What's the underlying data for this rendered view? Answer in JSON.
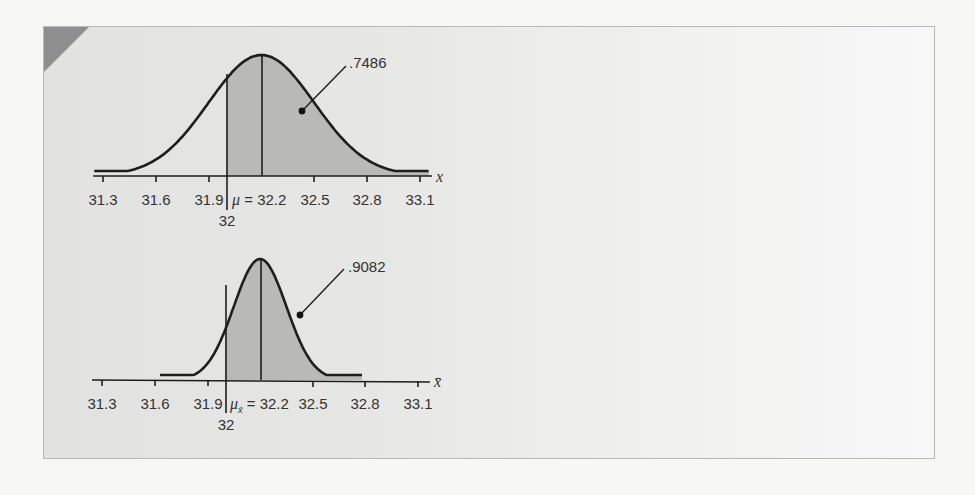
{
  "chart_data": [
    {
      "type": "area",
      "title": "",
      "distribution": "normal",
      "variable": "x",
      "xlabel": "x",
      "ylabel": "",
      "mean": 32.2,
      "std_dev": 0.3,
      "mean_label": "μ = 32.2",
      "x_ticks": [
        31.3,
        31.6,
        31.9,
        32.2,
        32.5,
        32.8,
        33.1
      ],
      "x_tick_labels": [
        "31.3",
        "31.6",
        "31.9",
        "",
        "32.5",
        "32.8",
        "33.1"
      ],
      "xlim": [
        31.25,
        33.15
      ],
      "shaded_from": 32,
      "shaded_to": 33.15,
      "shaded_marker_label": "32",
      "shaded_area": 0.7486,
      "shaded_area_label": ".7486",
      "curve_range": [
        31.25,
        33.15
      ],
      "grid": false
    },
    {
      "type": "area",
      "title": "",
      "distribution": "normal",
      "variable": "x̄",
      "xlabel": "x̄",
      "ylabel": "",
      "mean": 32.2,
      "std_dev": 0.15,
      "mean_label": "μx̄ = 32.2",
      "x_ticks": [
        31.3,
        31.6,
        31.9,
        32.2,
        32.5,
        32.8,
        33.1
      ],
      "x_tick_labels": [
        "31.3",
        "31.6",
        "31.9",
        "",
        "32.5",
        "32.8",
        "33.1"
      ],
      "xlim": [
        31.25,
        33.15
      ],
      "shaded_from": 32,
      "shaded_to": 32.78,
      "shaded_marker_label": "32",
      "shaded_area": 0.9082,
      "shaded_area_label": ".9082",
      "curve_range": [
        31.63,
        32.78
      ],
      "grid": false
    }
  ],
  "colors": {
    "page_background": "#f7f7f6",
    "frame_background": "#e4e4e3",
    "frame_border": "#b9b9b9",
    "corner_accent": "#8f8f8f",
    "shaded_area": "#b9b9b8",
    "curve": "#1e1e1e",
    "text": "#333333"
  },
  "top": {
    "area_label": ".7486",
    "marker_label": "32",
    "mean_symbol": "μ",
    "mean_text": " = 32.2",
    "axis_var": "x",
    "ticks": [
      "31.3",
      "31.6",
      "31.9",
      "32.5",
      "32.8",
      "33.1"
    ]
  },
  "bottom": {
    "area_label": ".9082",
    "marker_label": "32",
    "mean_symbol": "μ",
    "mean_sub": "x̄",
    "mean_text": " = 32.2",
    "axis_var": "x̄",
    "ticks": [
      "31.3",
      "31.6",
      "31.9",
      "32.5",
      "32.8",
      "33.1"
    ]
  }
}
